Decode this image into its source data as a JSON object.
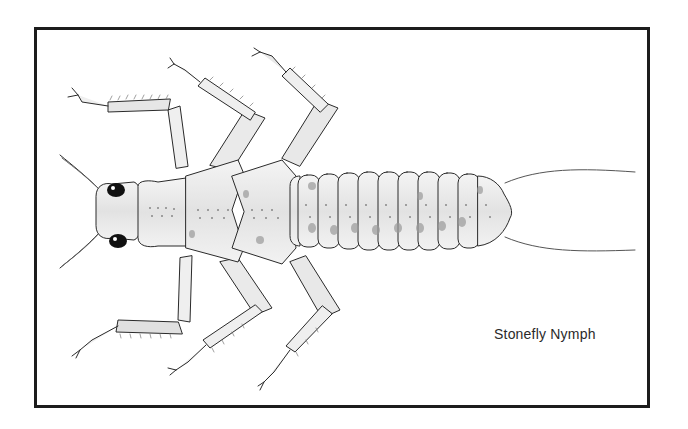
{
  "figure": {
    "caption": "Stonefly Nymph",
    "style": "pen-and-ink with gray wash",
    "colors": {
      "background": "#ffffff",
      "frame": "#1c1c1c",
      "ink": "#2a2a2a",
      "wash": "#c8c8c8",
      "eye": "#111111"
    },
    "anatomy": {
      "antennae": 2,
      "eyes": 2,
      "thorax_segments": 3,
      "abdomen_segments": 10,
      "legs": 6,
      "cerci": 2
    }
  }
}
